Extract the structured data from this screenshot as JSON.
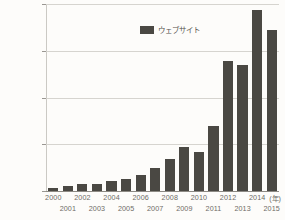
{
  "chart_data": {
    "type": "bar",
    "title": "",
    "subtitle": "",
    "xlabel": "(年)",
    "ylabel": "",
    "categories": [
      "2000",
      "2001",
      "2002",
      "2003",
      "2004",
      "2005",
      "2006",
      "2007",
      "2008",
      "2009",
      "2010",
      "2011",
      "2012",
      "2013",
      "2014",
      "2015"
    ],
    "values": [
      17000000,
      29000000,
      38000000,
      40000000,
      51000000,
      64000000,
      85000000,
      121000000,
      172000000,
      238000000,
      207000000,
      347000000,
      697000000,
      672000000,
      968000000,
      863000000
    ],
    "series": [
      {
        "name": "ウェブサイト",
        "values": [
          17000000,
          29000000,
          38000000,
          40000000,
          51000000,
          64000000,
          85000000,
          121000000,
          172000000,
          238000000,
          207000000,
          347000000,
          697000000,
          672000000,
          968000000,
          863000000
        ],
        "color": "#4a4843"
      }
    ],
    "ylim": [
      0,
      1000000000
    ],
    "yticks": [
      0,
      250000000,
      500000000,
      750000000,
      1000000000
    ],
    "ytick_labels": [
      "0",
      "250,000,000",
      "500,000,000",
      "750,000,000",
      "1,000,000,000"
    ],
    "grid": true,
    "legend": {
      "position": "top-center",
      "entries": [
        {
          "label": "ウェブサイト",
          "color": "#4a4843"
        }
      ]
    },
    "colors": {
      "bar": "#4a4843",
      "background": "#fdfcfa",
      "gridline": "#d6d4cf",
      "baseline": "#8d8a84",
      "text": "#6e6b66"
    }
  }
}
